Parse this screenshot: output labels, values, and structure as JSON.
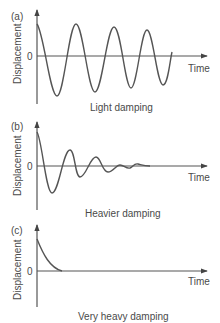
{
  "figure": {
    "panels": [
      {
        "tag": "(a)",
        "ylabel": "Displacement",
        "xlabel": "Time",
        "zero_label": "0",
        "caption": "Light damping"
      },
      {
        "tag": "(b)",
        "ylabel": "Displacement",
        "xlabel": "Time",
        "zero_label": "0",
        "caption": "Heavier damping"
      },
      {
        "tag": "(c)",
        "ylabel": "Displacement",
        "xlabel": "Time",
        "zero_label": "0",
        "caption": "Very heavy damping"
      }
    ],
    "colors": {
      "line": "#555555",
      "text": "#4a4a4a",
      "background": "#ffffff"
    }
  }
}
